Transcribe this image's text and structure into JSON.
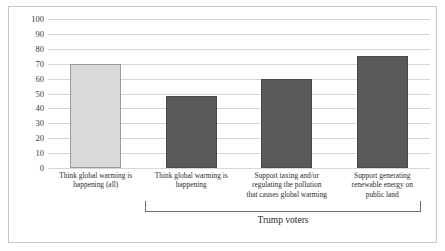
{
  "chart_data": {
    "type": "bar",
    "title": "",
    "subtitle": "",
    "xlabel": "",
    "ylabel": "",
    "ylim": [
      0,
      100
    ],
    "yticks": [
      0,
      10,
      20,
      30,
      40,
      50,
      60,
      70,
      80,
      90,
      100
    ],
    "grid": "horizontal",
    "legend": "none",
    "categories": [
      "Think global warming is happening (all)",
      "Think global warming is happening",
      "Support taxing and/or regulating the pollution that causes global warming",
      "Support generating renewable energy on public land"
    ],
    "values": [
      70,
      48,
      60,
      75
    ],
    "bar_colors": [
      "#d9d9d9",
      "#595959",
      "#595959",
      "#595959"
    ],
    "annotations": [
      {
        "text": "Trump voters",
        "type": "bracket",
        "spans_categories": [
          1,
          2,
          3
        ]
      }
    ]
  },
  "axis": {
    "y_tick_labels": [
      "100",
      "90",
      "80",
      "70",
      "60",
      "50",
      "40",
      "30",
      "20",
      "10",
      "0"
    ]
  },
  "category_labels": [
    {
      "lines": [
        "Think global warming is",
        "happening (all)"
      ]
    },
    {
      "lines": [
        "Think global warming is",
        "happening"
      ]
    },
    {
      "lines": [
        "Support taxing and/or",
        "regulating the pollution",
        "that causes global warming"
      ]
    },
    {
      "lines": [
        "Support generating",
        "renewable energy on",
        "public land"
      ]
    }
  ],
  "bracket": {
    "label": "Trump voters"
  },
  "colors": {
    "bar_light": "#d9d9d9",
    "bar_dark": "#595959",
    "gridline": "#d6d6d6",
    "frame": "#c8c8c8",
    "text": "#2d2d2d"
  }
}
